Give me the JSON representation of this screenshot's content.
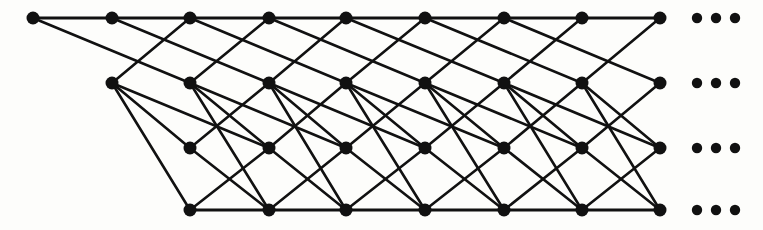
{
  "figure": {
    "title": "Infinite layered lattice graph",
    "type": "node-link-diagram",
    "background_color": "#fdfdfb",
    "node_color": "#111111",
    "edge_color": "#111111",
    "continuation_marker": "• • •",
    "continuation_label": "ellipsis",
    "rows_label": "4",
    "columns_label": "9"
  },
  "graph_data": {
    "type": "graph",
    "directed": false,
    "rows": 4,
    "row_y": [
      18,
      83,
      148,
      210
    ],
    "col_x": [
      33,
      112,
      190,
      269,
      346,
      425,
      504,
      582,
      660
    ],
    "node_radius": 6.5,
    "nodes": [
      {
        "id": "r0c0",
        "row": 0,
        "col": 0,
        "x": 33,
        "y": 18
      },
      {
        "id": "r0c1",
        "row": 0,
        "col": 1,
        "x": 112,
        "y": 18
      },
      {
        "id": "r0c2",
        "row": 0,
        "col": 2,
        "x": 190,
        "y": 18
      },
      {
        "id": "r0c3",
        "row": 0,
        "col": 3,
        "x": 269,
        "y": 18
      },
      {
        "id": "r0c4",
        "row": 0,
        "col": 4,
        "x": 346,
        "y": 18
      },
      {
        "id": "r0c5",
        "row": 0,
        "col": 5,
        "x": 425,
        "y": 18
      },
      {
        "id": "r0c6",
        "row": 0,
        "col": 6,
        "x": 504,
        "y": 18
      },
      {
        "id": "r0c7",
        "row": 0,
        "col": 7,
        "x": 582,
        "y": 18
      },
      {
        "id": "r0c8",
        "row": 0,
        "col": 8,
        "x": 660,
        "y": 18
      },
      {
        "id": "r1c1",
        "row": 1,
        "col": 1,
        "x": 112,
        "y": 83
      },
      {
        "id": "r1c2",
        "row": 1,
        "col": 2,
        "x": 190,
        "y": 83
      },
      {
        "id": "r1c3",
        "row": 1,
        "col": 3,
        "x": 269,
        "y": 83
      },
      {
        "id": "r1c4",
        "row": 1,
        "col": 4,
        "x": 346,
        "y": 83
      },
      {
        "id": "r1c5",
        "row": 1,
        "col": 5,
        "x": 425,
        "y": 83
      },
      {
        "id": "r1c6",
        "row": 1,
        "col": 6,
        "x": 504,
        "y": 83
      },
      {
        "id": "r1c7",
        "row": 1,
        "col": 7,
        "x": 582,
        "y": 83
      },
      {
        "id": "r1c8",
        "row": 1,
        "col": 8,
        "x": 660,
        "y": 83
      },
      {
        "id": "r2c2",
        "row": 2,
        "col": 2,
        "x": 190,
        "y": 148
      },
      {
        "id": "r2c3",
        "row": 2,
        "col": 3,
        "x": 269,
        "y": 148
      },
      {
        "id": "r2c4",
        "row": 2,
        "col": 4,
        "x": 346,
        "y": 148
      },
      {
        "id": "r2c5",
        "row": 2,
        "col": 5,
        "x": 425,
        "y": 148
      },
      {
        "id": "r2c6",
        "row": 2,
        "col": 6,
        "x": 504,
        "y": 148
      },
      {
        "id": "r2c7",
        "row": 2,
        "col": 7,
        "x": 582,
        "y": 148
      },
      {
        "id": "r2c8",
        "row": 2,
        "col": 8,
        "x": 660,
        "y": 148
      },
      {
        "id": "r3c2",
        "row": 3,
        "col": 2,
        "x": 190,
        "y": 210
      },
      {
        "id": "r3c3",
        "row": 3,
        "col": 3,
        "x": 269,
        "y": 210
      },
      {
        "id": "r3c4",
        "row": 3,
        "col": 4,
        "x": 346,
        "y": 210
      },
      {
        "id": "r3c5",
        "row": 3,
        "col": 5,
        "x": 425,
        "y": 210
      },
      {
        "id": "r3c6",
        "row": 3,
        "col": 6,
        "x": 504,
        "y": 210
      },
      {
        "id": "r3c7",
        "row": 3,
        "col": 7,
        "x": 582,
        "y": 210
      },
      {
        "id": "r3c8",
        "row": 3,
        "col": 8,
        "x": 660,
        "y": 210
      }
    ],
    "edges": [
      {
        "from": "r0c0",
        "to": "r0c1",
        "kind": "rail"
      },
      {
        "from": "r0c1",
        "to": "r0c2",
        "kind": "rail"
      },
      {
        "from": "r0c2",
        "to": "r0c3",
        "kind": "rail"
      },
      {
        "from": "r0c3",
        "to": "r0c4",
        "kind": "rail"
      },
      {
        "from": "r0c4",
        "to": "r0c5",
        "kind": "rail"
      },
      {
        "from": "r0c5",
        "to": "r0c6",
        "kind": "rail"
      },
      {
        "from": "r0c6",
        "to": "r0c7",
        "kind": "rail"
      },
      {
        "from": "r0c7",
        "to": "r0c8",
        "kind": "rail"
      },
      {
        "from": "r3c2",
        "to": "r3c3",
        "kind": "rail"
      },
      {
        "from": "r3c3",
        "to": "r3c4",
        "kind": "rail"
      },
      {
        "from": "r3c4",
        "to": "r3c5",
        "kind": "rail"
      },
      {
        "from": "r3c5",
        "to": "r3c6",
        "kind": "rail"
      },
      {
        "from": "r3c6",
        "to": "r3c7",
        "kind": "rail"
      },
      {
        "from": "r3c7",
        "to": "r3c8",
        "kind": "rail"
      },
      {
        "from": "r0c0",
        "to": "r1c2",
        "kind": "long-diag"
      },
      {
        "from": "r0c1",
        "to": "r1c3",
        "kind": "long-diag"
      },
      {
        "from": "r0c2",
        "to": "r1c4",
        "kind": "long-diag"
      },
      {
        "from": "r0c3",
        "to": "r1c5",
        "kind": "long-diag"
      },
      {
        "from": "r0c4",
        "to": "r1c6",
        "kind": "long-diag"
      },
      {
        "from": "r0c5",
        "to": "r1c7",
        "kind": "long-diag"
      },
      {
        "from": "r0c6",
        "to": "r1c8",
        "kind": "long-diag"
      },
      {
        "from": "r1c1",
        "to": "r0c2",
        "kind": "up-diag"
      },
      {
        "from": "r1c2",
        "to": "r0c3",
        "kind": "up-diag"
      },
      {
        "from": "r1c3",
        "to": "r0c4",
        "kind": "up-diag"
      },
      {
        "from": "r1c4",
        "to": "r0c5",
        "kind": "up-diag"
      },
      {
        "from": "r1c5",
        "to": "r0c6",
        "kind": "up-diag"
      },
      {
        "from": "r1c6",
        "to": "r0c7",
        "kind": "up-diag"
      },
      {
        "from": "r1c7",
        "to": "r0c8",
        "kind": "up-diag"
      },
      {
        "from": "r1c1",
        "to": "r2c3",
        "kind": "long-diag"
      },
      {
        "from": "r1c2",
        "to": "r2c4",
        "kind": "long-diag"
      },
      {
        "from": "r1c3",
        "to": "r2c5",
        "kind": "long-diag"
      },
      {
        "from": "r1c4",
        "to": "r2c6",
        "kind": "long-diag"
      },
      {
        "from": "r1c5",
        "to": "r2c7",
        "kind": "long-diag"
      },
      {
        "from": "r1c6",
        "to": "r2c8",
        "kind": "long-diag"
      },
      {
        "from": "r1c1",
        "to": "r2c2",
        "kind": "down-diag"
      },
      {
        "from": "r1c2",
        "to": "r2c3",
        "kind": "down-diag"
      },
      {
        "from": "r1c3",
        "to": "r2c4",
        "kind": "down-diag"
      },
      {
        "from": "r1c4",
        "to": "r2c5",
        "kind": "down-diag"
      },
      {
        "from": "r1c5",
        "to": "r2c6",
        "kind": "down-diag"
      },
      {
        "from": "r1c6",
        "to": "r2c7",
        "kind": "down-diag"
      },
      {
        "from": "r1c7",
        "to": "r2c8",
        "kind": "down-diag"
      },
      {
        "from": "r2c2",
        "to": "r1c3",
        "kind": "up-diag"
      },
      {
        "from": "r2c3",
        "to": "r1c4",
        "kind": "up-diag"
      },
      {
        "from": "r2c4",
        "to": "r1c5",
        "kind": "up-diag"
      },
      {
        "from": "r2c5",
        "to": "r1c6",
        "kind": "up-diag"
      },
      {
        "from": "r2c6",
        "to": "r1c7",
        "kind": "up-diag"
      },
      {
        "from": "r2c7",
        "to": "r1c8",
        "kind": "up-diag"
      },
      {
        "from": "r1c1",
        "to": "r3c2",
        "kind": "steep-diag"
      },
      {
        "from": "r1c2",
        "to": "r3c3",
        "kind": "steep-diag"
      },
      {
        "from": "r1c3",
        "to": "r3c4",
        "kind": "steep-diag"
      },
      {
        "from": "r1c4",
        "to": "r3c5",
        "kind": "steep-diag"
      },
      {
        "from": "r1c5",
        "to": "r3c6",
        "kind": "steep-diag"
      },
      {
        "from": "r1c6",
        "to": "r3c7",
        "kind": "steep-diag"
      },
      {
        "from": "r1c7",
        "to": "r3c8",
        "kind": "steep-diag"
      },
      {
        "from": "r2c2",
        "to": "r3c3",
        "kind": "down-diag"
      },
      {
        "from": "r2c3",
        "to": "r3c4",
        "kind": "down-diag"
      },
      {
        "from": "r2c4",
        "to": "r3c5",
        "kind": "down-diag"
      },
      {
        "from": "r2c5",
        "to": "r3c6",
        "kind": "down-diag"
      },
      {
        "from": "r2c6",
        "to": "r3c7",
        "kind": "down-diag"
      },
      {
        "from": "r2c7",
        "to": "r3c8",
        "kind": "down-diag"
      },
      {
        "from": "r3c2",
        "to": "r2c3",
        "kind": "up-diag"
      },
      {
        "from": "r3c3",
        "to": "r2c4",
        "kind": "up-diag"
      },
      {
        "from": "r3c4",
        "to": "r2c5",
        "kind": "up-diag"
      },
      {
        "from": "r3c5",
        "to": "r2c6",
        "kind": "up-diag"
      },
      {
        "from": "r3c6",
        "to": "r2c7",
        "kind": "up-diag"
      },
      {
        "from": "r3c7",
        "to": "r2c8",
        "kind": "up-diag"
      }
    ],
    "ellipses": [
      {
        "id": "ell-row0",
        "row": 0,
        "y": 18,
        "dots_x": [
          697,
          716,
          735
        ]
      },
      {
        "id": "ell-row1",
        "row": 1,
        "y": 83,
        "dots_x": [
          697,
          716,
          735
        ]
      },
      {
        "id": "ell-row2",
        "row": 2,
        "y": 148,
        "dots_x": [
          697,
          716,
          735
        ]
      },
      {
        "id": "ell-row3",
        "row": 3,
        "y": 210,
        "dots_x": [
          697,
          716,
          735
        ]
      }
    ],
    "dot_radius": 5.2
  }
}
